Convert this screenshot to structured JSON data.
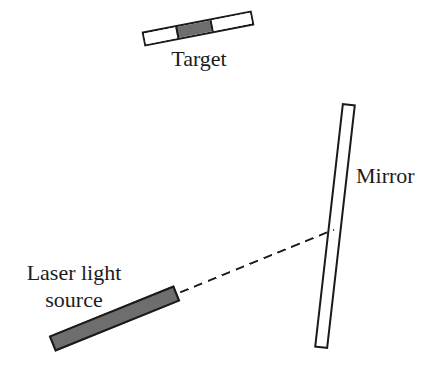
{
  "figure": {
    "type": "optics-ray-diagram",
    "labels": {
      "target": "Target",
      "mirror": "Mirror",
      "laser_line1": "Laser light",
      "laser_line2": "source"
    },
    "colors": {
      "outline": "#1a1a1a",
      "filled_gray": "#6e6e6e",
      "background": "#ffffff",
      "text": "#1c1c1c"
    }
  }
}
